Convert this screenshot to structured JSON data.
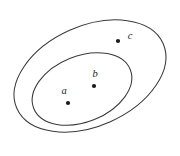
{
  "diagram": {
    "kind": "nested-set-euler-diagram",
    "background_color": "#ffffff",
    "stroke_color": "#3a3a3a",
    "dot_color": "#1a1a1a",
    "label_color": "#1d1d1d",
    "canvas": {
      "width": 180,
      "height": 156
    },
    "sets": [
      {
        "name": "outer-set",
        "shape": "ellipse",
        "cx": 90,
        "cy": 76,
        "rx": 80,
        "ry": 50,
        "rotation_deg": -24
      },
      {
        "name": "inner-set",
        "shape": "ellipse",
        "cx": 82,
        "cy": 89,
        "rx": 52,
        "ry": 33,
        "rotation_deg": -22
      }
    ],
    "points": [
      {
        "id": "point-a",
        "label": "a",
        "dot_x": 68,
        "dot_y": 103,
        "dot_r": 2.1,
        "label_x": 64,
        "label_y": 94,
        "containment": "inner-set"
      },
      {
        "id": "point-b",
        "label": "b",
        "dot_x": 94,
        "dot_y": 86,
        "dot_r": 2.1,
        "label_x": 95,
        "label_y": 77,
        "containment": "inner-set"
      },
      {
        "id": "point-c",
        "label": "c",
        "dot_x": 118,
        "dot_y": 41,
        "dot_r": 2.1,
        "label_x": 130,
        "label_y": 39,
        "containment": "outer-set"
      }
    ]
  }
}
